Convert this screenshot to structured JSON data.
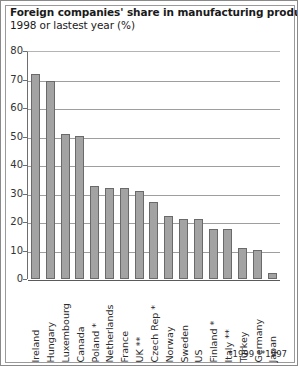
{
  "chart_data": {
    "type": "bar",
    "title": "Foreign companies' share in manufacturing production",
    "subtitle": "1998 or lastest year (%)",
    "xlabel": "",
    "ylabel": "",
    "ylim": [
      0,
      80
    ],
    "ytick_values": [
      80,
      70,
      60,
      50,
      40,
      30,
      20,
      10,
      0
    ],
    "ytick_labels": [
      "80",
      "70",
      "60",
      "50",
      "40",
      "30",
      "20",
      "10",
      "0"
    ],
    "grid": true,
    "legend": "none",
    "bar_color": "#a3a3a3",
    "bar_edge_color": "#6a6a6a",
    "categories": [
      "Ireland",
      "Hungary",
      "Luxembourg",
      "Canada",
      "Poland *",
      "Netherlands",
      "France",
      "UK **",
      "Czech Rep *",
      "Norway",
      "Sweden",
      "US",
      "Finland *",
      "Italy **",
      "Turkey",
      "Germany",
      "Japan"
    ],
    "values": [
      72,
      69.5,
      51,
      50,
      32.5,
      32,
      32,
      31,
      27,
      22,
      21,
      21,
      17.5,
      17.5,
      11,
      10,
      2
    ],
    "annotations": [
      "*1999  **1997"
    ]
  },
  "footnote": {
    "text": "*1999 **1997"
  }
}
